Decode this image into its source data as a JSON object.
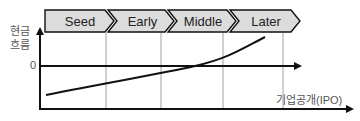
{
  "diagram": {
    "stages": [
      {
        "label": "Seed"
      },
      {
        "label": "Early"
      },
      {
        "label": "Middle"
      },
      {
        "label": "Later"
      }
    ],
    "y_axis_label_line1": "현금",
    "y_axis_label_line2": "흐름",
    "zero_label": "0",
    "x_axis_label": "기업공개(IPO)",
    "colors": {
      "stage_fill": "#dcdcdc",
      "stroke": "#111111",
      "divider": "#888888",
      "text": "#555555"
    }
  }
}
